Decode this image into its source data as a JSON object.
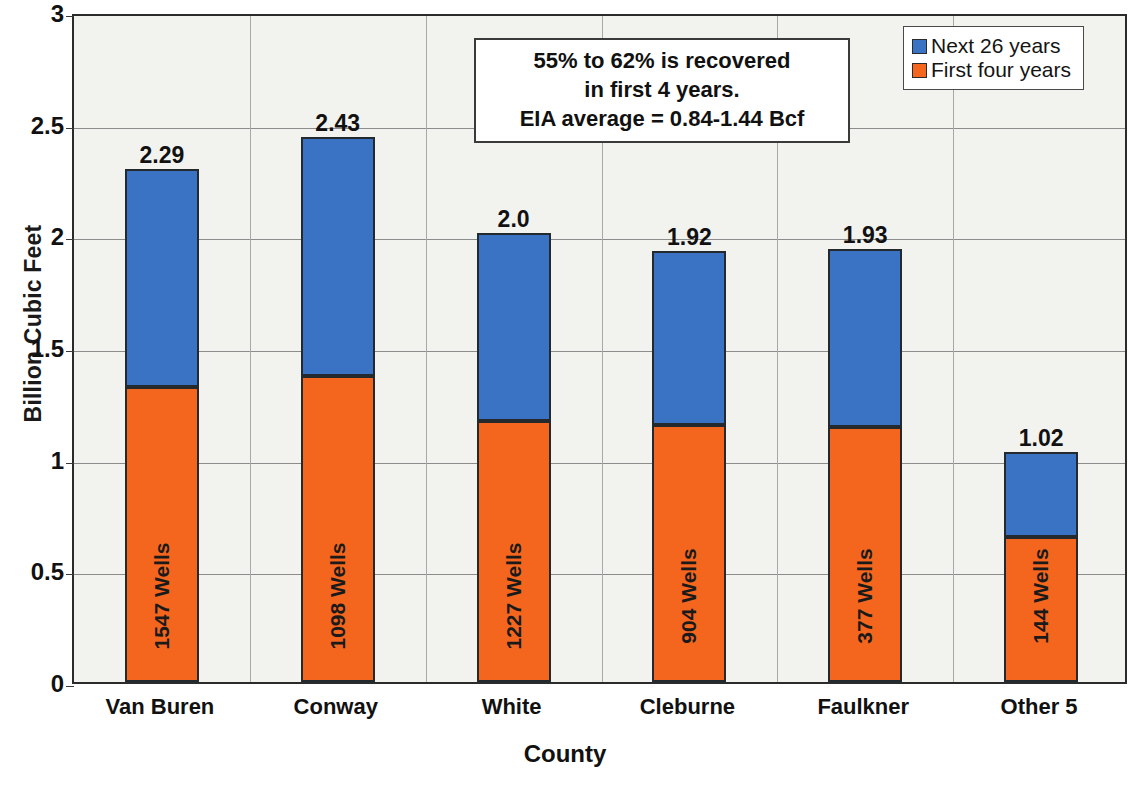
{
  "chart_data": {
    "type": "bar",
    "subtype": "stacked-vertical",
    "title": "",
    "xlabel": "County",
    "ylabel": "Billion Cubic Feet",
    "ylim": [
      0,
      3
    ],
    "ytick_labels": [
      "3",
      "2.5",
      "2",
      "1.5",
      "1",
      "0.5",
      "0"
    ],
    "ytick_values": [
      3,
      2.5,
      2,
      1.5,
      1,
      0.5,
      0
    ],
    "grid": true,
    "legend_position": "top-right",
    "categories": [
      "Van Buren",
      "Conway",
      "White",
      "Cleburne",
      "Faulkner",
      "Other 5"
    ],
    "series": [
      {
        "name": "First four years",
        "color": "#F4661E",
        "values": [
          1.32,
          1.37,
          1.17,
          1.15,
          1.14,
          0.65
        ]
      },
      {
        "name": "Next 26 years",
        "color": "#3B73C4",
        "values": [
          0.97,
          1.06,
          0.83,
          0.77,
          0.79,
          0.37
        ]
      }
    ],
    "totals": [
      2.29,
      2.43,
      2.0,
      1.92,
      1.93,
      1.02
    ],
    "total_labels": [
      "2.29",
      "2.43",
      "2.0",
      "1.92",
      "1.93",
      "1.02"
    ],
    "bar_inner_labels": [
      "1547 Wells",
      "1098 Wells",
      "1227 Wells",
      "904 Wells",
      "377 Wells",
      "144 Wells"
    ],
    "wells": [
      1547,
      1098,
      1227,
      904,
      377,
      144
    ],
    "annotations": [
      "55% to 62% is recovered",
      "in first 4 years.",
      "EIA average = 0.84-1.44 Bcf"
    ]
  },
  "legend": {
    "items": [
      {
        "label": "Next 26 years",
        "color": "#3B73C4"
      },
      {
        "label": "First four years",
        "color": "#F4661E"
      }
    ]
  },
  "axes": {
    "y_title": "Billion Cubic Feet",
    "x_title": "County"
  },
  "colors": {
    "series_blue": "#3B73C4",
    "series_orange": "#F4661E",
    "plot_background": "#F2F2EE",
    "axis_line": "#2B2B2B",
    "gridline": "#8C8C8C",
    "text": "#111111"
  }
}
